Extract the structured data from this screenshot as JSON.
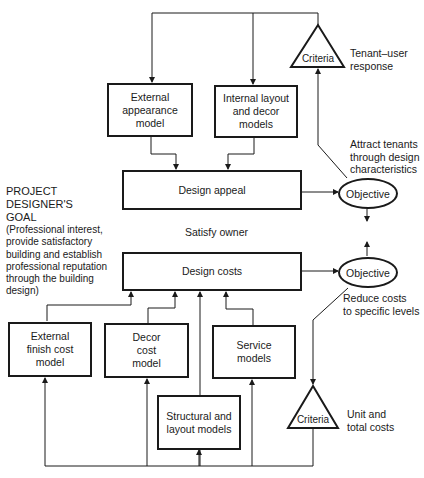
{
  "diagram": {
    "goal": {
      "title": "PROJECT\nDESIGNER'S\nGOAL",
      "description": "(Professional interest,\n provide satisfactory\n building and establish\n professional reputation\n through the building\n design)"
    },
    "boxes": {
      "external_appearance": "External appearance model",
      "internal_layout": "Internal layout and decor models",
      "design_appeal": "Design appeal",
      "design_costs": "Design costs",
      "external_finish": "External finish cost model",
      "decor_cost": "Decor cost model",
      "service": "Service models",
      "structural": "Structural and layout models"
    },
    "objectives": {
      "top": "Objective",
      "bottom": "Objective"
    },
    "criteria": {
      "top": "Criteria",
      "bottom": "Criteria"
    },
    "annotations": {
      "tenant_response": "Tenant–user\nresponse",
      "attract_tenants": "Attract tenants\nthrough design\ncharacteristics",
      "satisfy_owner": "Satisfy owner",
      "reduce_costs": "Reduce costs\nto specific levels",
      "unit_costs": "Unit  and\ntotal  costs"
    },
    "colors": {
      "line": "#1a1a1a",
      "background": "#ffffff"
    }
  }
}
